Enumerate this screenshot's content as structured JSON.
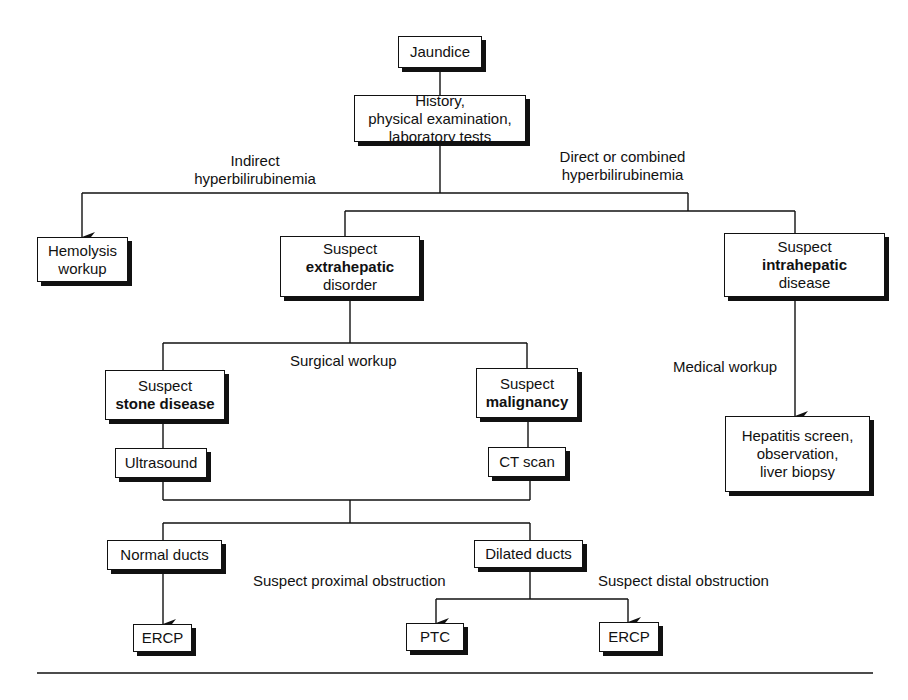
{
  "nodes": {
    "jaundice": {
      "line1": "Jaundice"
    },
    "history": {
      "line1": "History,",
      "line2": "physical examination,",
      "line3": "laboratory tests"
    },
    "hemolysis": {
      "line1": "Hemolysis",
      "line2": "workup"
    },
    "extrahepatic": {
      "line1": "Suspect",
      "line2": "extrahepatic",
      "line3": "disorder"
    },
    "intrahepatic": {
      "line1": "Suspect",
      "line2": "intrahepatic",
      "line3": "disease"
    },
    "stone": {
      "line1": "Suspect",
      "line2": "stone disease"
    },
    "malignancy": {
      "line1": "Suspect",
      "line2": "malignancy"
    },
    "ultrasound": {
      "line1": "Ultrasound"
    },
    "ctscan": {
      "line1": "CT scan"
    },
    "hepatitis": {
      "line1": "Hepatitis screen,",
      "line2": "observation,",
      "line3": "liver biopsy"
    },
    "normal_ducts": {
      "line1": "Normal ducts"
    },
    "dilated_ducts": {
      "line1": "Dilated ducts"
    },
    "ercp_left": {
      "line1": "ERCP"
    },
    "ptc": {
      "line1": "PTC"
    },
    "ercp_right": {
      "line1": "ERCP"
    }
  },
  "edge_labels": {
    "indirect": {
      "line1": "Indirect",
      "line2": "hyperbilirubinemia"
    },
    "direct": {
      "line1": "Direct or combined",
      "line2": "hyperbilirubinemia"
    },
    "surgical": "Surgical workup",
    "medical": "Medical workup",
    "proximal": "Suspect proximal obstruction",
    "distal": "Suspect distal obstruction"
  }
}
